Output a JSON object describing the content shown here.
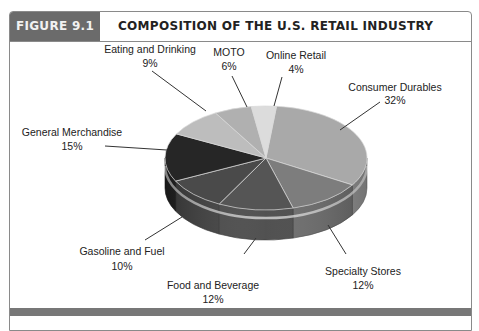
{
  "figure": {
    "label": "FIGURE 9.1",
    "title": "COMPOSITION OF THE U.S. RETAIL INDUSTRY"
  },
  "chart_data": {
    "type": "pie",
    "style": "3d",
    "title": "COMPOSITION OF THE U.S. RETAIL INDUSTRY",
    "categories": [
      "Consumer Durables",
      "Specialty Stores",
      "Food and Beverage",
      "Gasoline and Fuel",
      "General Merchandise",
      "Eating and Drinking",
      "MOTO",
      "Online Retail"
    ],
    "values": [
      32,
      12,
      12,
      10,
      15,
      9,
      6,
      4
    ],
    "unit": "%",
    "legend": "none (direct labels with leader lines)",
    "slices": [
      {
        "label": "Consumer Durables",
        "pct": "32%",
        "value": 32,
        "color": "#a9a9a9"
      },
      {
        "label": "Specialty Stores",
        "pct": "12%",
        "value": 12,
        "color": "#7d7d7d"
      },
      {
        "label": "Food and Beverage",
        "pct": "12%",
        "value": 12,
        "color": "#555555"
      },
      {
        "label": "Gasoline and Fuel",
        "pct": "10%",
        "value": 10,
        "color": "#4a4a4a"
      },
      {
        "label": "General Merchandise",
        "pct": "15%",
        "value": 15,
        "color": "#262626"
      },
      {
        "label": "Eating and Drinking",
        "pct": "9%",
        "value": 9,
        "color": "#bdbdbd"
      },
      {
        "label": "MOTO",
        "pct": "6%",
        "value": 6,
        "color": "#b0b0b0"
      },
      {
        "label": "Online Retail",
        "pct": "4%",
        "value": 4,
        "color": "#dcdcdc"
      }
    ]
  }
}
